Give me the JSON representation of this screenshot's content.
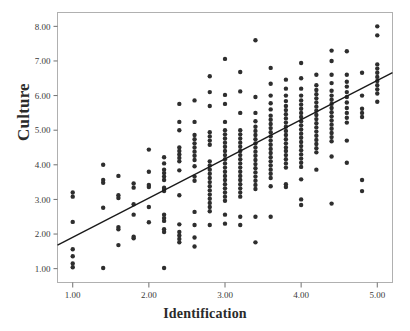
{
  "chart_data": {
    "type": "scatter",
    "title": "",
    "xlabel": "Identification",
    "ylabel": "Culture",
    "xlim": [
      0.8,
      5.2
    ],
    "ylim": [
      0.6,
      8.4
    ],
    "xticks": [
      "1.00",
      "2.00",
      "3.00",
      "4.00",
      "5.00"
    ],
    "xtick_values": [
      1.0,
      2.0,
      3.0,
      4.0,
      5.0
    ],
    "yticks": [
      "1.00",
      "2.00",
      "3.00",
      "4.00",
      "5.00",
      "6.00",
      "7.00",
      "8.00"
    ],
    "ytick_values": [
      1.0,
      2.0,
      3.0,
      4.0,
      5.0,
      6.0,
      7.0,
      8.0
    ],
    "grid": false,
    "legend": null,
    "marker": "filled-circle",
    "marker_color": "#2e2e2e",
    "marker_size": 2.2,
    "frame_color": "#b0b0b0",
    "fit_line": {
      "type": "linear",
      "color": "#1a1a1a",
      "width": 1.4,
      "x_start": 0.8,
      "y_start": 1.68,
      "x_end": 5.2,
      "y_end": 6.66,
      "slope": 1.132,
      "intercept": 0.774
    },
    "series": [
      {
        "name": "Culture vs Identification",
        "points": [
          [
            1.0,
            3.2
          ],
          [
            1.0,
            3.08
          ],
          [
            1.0,
            2.35
          ],
          [
            1.0,
            1.56
          ],
          [
            1.0,
            1.36
          ],
          [
            1.0,
            1.15
          ],
          [
            1.0,
            1.04
          ],
          [
            1.4,
            4.0
          ],
          [
            1.4,
            3.56
          ],
          [
            1.4,
            3.48
          ],
          [
            1.4,
            2.76
          ],
          [
            1.4,
            1.02
          ],
          [
            1.6,
            3.68
          ],
          [
            1.6,
            3.12
          ],
          [
            1.6,
            3.04
          ],
          [
            1.6,
            2.2
          ],
          [
            1.6,
            2.14
          ],
          [
            1.6,
            1.68
          ],
          [
            1.8,
            3.46
          ],
          [
            1.8,
            3.34
          ],
          [
            1.8,
            2.86
          ],
          [
            1.8,
            2.56
          ],
          [
            1.8,
            1.92
          ],
          [
            1.8,
            1.88
          ],
          [
            2.0,
            4.44
          ],
          [
            2.0,
            3.8
          ],
          [
            2.0,
            3.42
          ],
          [
            2.0,
            3.36
          ],
          [
            2.0,
            2.78
          ],
          [
            2.0,
            2.34
          ],
          [
            2.2,
            4.22
          ],
          [
            2.2,
            4.04
          ],
          [
            2.2,
            3.86
          ],
          [
            2.2,
            3.76
          ],
          [
            2.2,
            3.66
          ],
          [
            2.2,
            3.56
          ],
          [
            2.2,
            3.34
          ],
          [
            2.2,
            3.3
          ],
          [
            2.2,
            3.24
          ],
          [
            2.2,
            2.56
          ],
          [
            2.2,
            2.46
          ],
          [
            2.2,
            2.38
          ],
          [
            2.2,
            2.14
          ],
          [
            2.2,
            2.06
          ],
          [
            2.2,
            1.02
          ],
          [
            2.4,
            5.76
          ],
          [
            2.4,
            5.24
          ],
          [
            2.4,
            5.0
          ],
          [
            2.4,
            4.5
          ],
          [
            2.4,
            4.4
          ],
          [
            2.4,
            4.3
          ],
          [
            2.4,
            4.2
          ],
          [
            2.4,
            4.1
          ],
          [
            2.4,
            3.84
          ],
          [
            2.4,
            3.12
          ],
          [
            2.4,
            2.28
          ],
          [
            2.4,
            2.06
          ],
          [
            2.4,
            1.96
          ],
          [
            2.4,
            1.86
          ],
          [
            2.4,
            1.76
          ],
          [
            2.6,
            5.86
          ],
          [
            2.6,
            5.24
          ],
          [
            2.6,
            4.86
          ],
          [
            2.6,
            4.74
          ],
          [
            2.6,
            4.62
          ],
          [
            2.6,
            4.5
          ],
          [
            2.6,
            4.38
          ],
          [
            2.6,
            4.26
          ],
          [
            2.6,
            4.14
          ],
          [
            2.6,
            3.96
          ],
          [
            2.6,
            3.66
          ],
          [
            2.6,
            3.54
          ],
          [
            2.6,
            2.64
          ],
          [
            2.6,
            2.26
          ],
          [
            2.6,
            1.9
          ],
          [
            2.6,
            1.64
          ],
          [
            2.8,
            6.56
          ],
          [
            2.8,
            6.1
          ],
          [
            2.8,
            5.7
          ],
          [
            2.8,
            4.94
          ],
          [
            2.8,
            4.82
          ],
          [
            2.8,
            4.7
          ],
          [
            2.8,
            4.58
          ],
          [
            2.8,
            4.1
          ],
          [
            2.8,
            3.98
          ],
          [
            2.8,
            3.86
          ],
          [
            2.8,
            3.74
          ],
          [
            2.8,
            3.62
          ],
          [
            2.8,
            3.5
          ],
          [
            2.8,
            3.38
          ],
          [
            2.8,
            3.26
          ],
          [
            2.8,
            3.14
          ],
          [
            2.8,
            3.02
          ],
          [
            2.8,
            2.9
          ],
          [
            2.8,
            2.78
          ],
          [
            2.8,
            2.66
          ],
          [
            2.8,
            2.26
          ],
          [
            3.0,
            7.06
          ],
          [
            3.0,
            6.02
          ],
          [
            3.0,
            5.76
          ],
          [
            3.0,
            5.24
          ],
          [
            3.0,
            5.0
          ],
          [
            3.0,
            4.88
          ],
          [
            3.0,
            4.76
          ],
          [
            3.0,
            4.64
          ],
          [
            3.0,
            4.52
          ],
          [
            3.0,
            4.4
          ],
          [
            3.0,
            4.28
          ],
          [
            3.0,
            4.16
          ],
          [
            3.0,
            4.04
          ],
          [
            3.0,
            3.92
          ],
          [
            3.0,
            3.8
          ],
          [
            3.0,
            3.68
          ],
          [
            3.0,
            3.56
          ],
          [
            3.0,
            3.44
          ],
          [
            3.0,
            3.32
          ],
          [
            3.0,
            3.2
          ],
          [
            3.0,
            3.08
          ],
          [
            3.0,
            2.96
          ],
          [
            3.0,
            2.56
          ],
          [
            3.0,
            2.3
          ],
          [
            3.2,
            6.68
          ],
          [
            3.2,
            6.12
          ],
          [
            3.2,
            5.5
          ],
          [
            3.2,
            5.0
          ],
          [
            3.2,
            4.88
          ],
          [
            3.2,
            4.76
          ],
          [
            3.2,
            4.64
          ],
          [
            3.2,
            4.52
          ],
          [
            3.2,
            4.4
          ],
          [
            3.2,
            4.28
          ],
          [
            3.2,
            4.16
          ],
          [
            3.2,
            4.04
          ],
          [
            3.2,
            3.92
          ],
          [
            3.2,
            3.8
          ],
          [
            3.2,
            3.68
          ],
          [
            3.2,
            3.56
          ],
          [
            3.2,
            3.44
          ],
          [
            3.2,
            3.32
          ],
          [
            3.2,
            3.2
          ],
          [
            3.2,
            3.08
          ],
          [
            3.2,
            2.5
          ],
          [
            3.2,
            2.26
          ],
          [
            3.4,
            7.6
          ],
          [
            3.4,
            5.96
          ],
          [
            3.4,
            5.5
          ],
          [
            3.4,
            5.26
          ],
          [
            3.4,
            5.1
          ],
          [
            3.4,
            4.98
          ],
          [
            3.4,
            4.86
          ],
          [
            3.4,
            4.74
          ],
          [
            3.4,
            4.62
          ],
          [
            3.4,
            4.5
          ],
          [
            3.4,
            4.38
          ],
          [
            3.4,
            4.26
          ],
          [
            3.4,
            4.14
          ],
          [
            3.4,
            4.02
          ],
          [
            3.4,
            3.9
          ],
          [
            3.4,
            3.78
          ],
          [
            3.4,
            3.66
          ],
          [
            3.4,
            3.54
          ],
          [
            3.4,
            3.42
          ],
          [
            3.4,
            3.3
          ],
          [
            3.4,
            2.5
          ],
          [
            3.4,
            1.76
          ],
          [
            3.6,
            6.8
          ],
          [
            3.6,
            6.34
          ],
          [
            3.6,
            6.0
          ],
          [
            3.6,
            5.78
          ],
          [
            3.6,
            5.6
          ],
          [
            3.6,
            5.42
          ],
          [
            3.6,
            5.3
          ],
          [
            3.6,
            5.18
          ],
          [
            3.6,
            5.06
          ],
          [
            3.6,
            4.94
          ],
          [
            3.6,
            4.82
          ],
          [
            3.6,
            4.7
          ],
          [
            3.6,
            4.58
          ],
          [
            3.6,
            4.46
          ],
          [
            3.6,
            4.34
          ],
          [
            3.6,
            4.22
          ],
          [
            3.6,
            4.1
          ],
          [
            3.6,
            3.98
          ],
          [
            3.6,
            3.86
          ],
          [
            3.6,
            3.74
          ],
          [
            3.6,
            3.62
          ],
          [
            3.6,
            3.38
          ],
          [
            3.6,
            2.5
          ],
          [
            3.8,
            6.46
          ],
          [
            3.8,
            6.2
          ],
          [
            3.8,
            6.0
          ],
          [
            3.8,
            5.84
          ],
          [
            3.8,
            5.7
          ],
          [
            3.8,
            5.58
          ],
          [
            3.8,
            5.46
          ],
          [
            3.8,
            5.34
          ],
          [
            3.8,
            5.22
          ],
          [
            3.8,
            5.1
          ],
          [
            3.8,
            4.98
          ],
          [
            3.8,
            4.86
          ],
          [
            3.8,
            4.74
          ],
          [
            3.8,
            4.62
          ],
          [
            3.8,
            4.5
          ],
          [
            3.8,
            4.4
          ],
          [
            3.8,
            4.28
          ],
          [
            3.8,
            4.16
          ],
          [
            3.8,
            4.04
          ],
          [
            3.8,
            3.92
          ],
          [
            3.8,
            3.44
          ],
          [
            3.8,
            3.36
          ],
          [
            4.0,
            6.94
          ],
          [
            4.0,
            6.5
          ],
          [
            4.0,
            6.2
          ],
          [
            4.0,
            6.0
          ],
          [
            4.0,
            5.86
          ],
          [
            4.0,
            5.74
          ],
          [
            4.0,
            5.62
          ],
          [
            4.0,
            5.5
          ],
          [
            4.0,
            5.38
          ],
          [
            4.0,
            5.26
          ],
          [
            4.0,
            5.14
          ],
          [
            4.0,
            5.02
          ],
          [
            4.0,
            4.9
          ],
          [
            4.0,
            4.78
          ],
          [
            4.0,
            4.66
          ],
          [
            4.0,
            4.54
          ],
          [
            4.0,
            4.42
          ],
          [
            4.0,
            4.3
          ],
          [
            4.0,
            4.18
          ],
          [
            4.0,
            4.06
          ],
          [
            4.0,
            3.94
          ],
          [
            4.0,
            3.58
          ],
          [
            4.0,
            3.0
          ],
          [
            4.0,
            2.84
          ],
          [
            4.2,
            6.6
          ],
          [
            4.2,
            6.3
          ],
          [
            4.2,
            6.16
          ],
          [
            4.2,
            6.04
          ],
          [
            4.2,
            5.92
          ],
          [
            4.2,
            5.8
          ],
          [
            4.2,
            5.68
          ],
          [
            4.2,
            5.56
          ],
          [
            4.2,
            5.44
          ],
          [
            4.2,
            5.32
          ],
          [
            4.2,
            5.2
          ],
          [
            4.2,
            5.08
          ],
          [
            4.2,
            4.96
          ],
          [
            4.2,
            4.84
          ],
          [
            4.2,
            4.72
          ],
          [
            4.2,
            4.6
          ],
          [
            4.2,
            4.48
          ],
          [
            4.2,
            4.36
          ],
          [
            4.2,
            3.86
          ],
          [
            4.4,
            7.3
          ],
          [
            4.4,
            7.0
          ],
          [
            4.4,
            6.6
          ],
          [
            4.4,
            6.36
          ],
          [
            4.4,
            6.14
          ],
          [
            4.4,
            6.0
          ],
          [
            4.4,
            5.88
          ],
          [
            4.4,
            5.76
          ],
          [
            4.4,
            5.64
          ],
          [
            4.4,
            5.52
          ],
          [
            4.4,
            5.4
          ],
          [
            4.4,
            5.28
          ],
          [
            4.4,
            5.16
          ],
          [
            4.4,
            5.04
          ],
          [
            4.4,
            4.92
          ],
          [
            4.4,
            4.8
          ],
          [
            4.4,
            4.68
          ],
          [
            4.4,
            4.24
          ],
          [
            4.4,
            2.88
          ],
          [
            4.6,
            7.28
          ],
          [
            4.6,
            6.6
          ],
          [
            4.6,
            6.4
          ],
          [
            4.6,
            6.26
          ],
          [
            4.6,
            6.1
          ],
          [
            4.6,
            5.96
          ],
          [
            4.6,
            5.8
          ],
          [
            4.6,
            5.64
          ],
          [
            4.6,
            5.5
          ],
          [
            4.6,
            5.36
          ],
          [
            4.6,
            5.22
          ],
          [
            4.6,
            4.7
          ],
          [
            4.6,
            4.06
          ],
          [
            4.8,
            6.66
          ],
          [
            4.8,
            6.0
          ],
          [
            4.8,
            5.62
          ],
          [
            4.8,
            5.5
          ],
          [
            4.8,
            5.38
          ],
          [
            4.8,
            3.56
          ],
          [
            4.8,
            3.24
          ],
          [
            5.0,
            8.0
          ],
          [
            5.0,
            7.74
          ],
          [
            5.0,
            6.9
          ],
          [
            5.0,
            6.78
          ],
          [
            5.0,
            6.66
          ],
          [
            5.0,
            6.54
          ],
          [
            5.0,
            6.42
          ],
          [
            5.0,
            6.3
          ],
          [
            5.0,
            6.18
          ],
          [
            5.0,
            6.06
          ],
          [
            5.0,
            5.82
          ]
        ]
      }
    ]
  },
  "axes": {
    "y_title": "Culture",
    "x_title": "Identification"
  }
}
